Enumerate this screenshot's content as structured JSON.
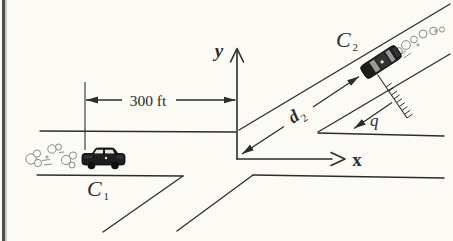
{
  "figure": {
    "colors": {
      "background": "#fbfaf5",
      "ink": "#2c2c2c",
      "car_body": "#1e1e1e",
      "smoke": "#8a8a8a",
      "page_edge": "#4f4f4f"
    },
    "labels": {
      "y_axis": "y",
      "x_axis": "x",
      "distance_dimension": "300 ft",
      "d2": {
        "letter": "d",
        "subscript": "2"
      },
      "skid_distance": "q",
      "car1": {
        "letter": "C",
        "subscript": "1"
      },
      "car2": {
        "letter": "C",
        "subscript": "2"
      }
    },
    "icons": {
      "car1": "car-side-silhouette",
      "car2": "car-rotated-silhouette",
      "smoke1": "exhaust-smoke-puffs",
      "smoke2": "exhaust-smoke-puffs",
      "skid_line": "hatched-tick-line",
      "dimension_arrows": "filled-triangle-arrowheads",
      "axis_arrows": "open-v-arrowheads"
    }
  }
}
